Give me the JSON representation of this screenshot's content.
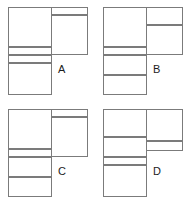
{
  "figure": {
    "kind": "multiple-choice-shape-options",
    "line_color": "#7b7b7b",
    "fill_color": "#ffffff",
    "label_color": "#1c1c1c",
    "background": "#ffffff",
    "option_count": 4
  },
  "options": [
    {
      "id": "a",
      "label": "A",
      "left_column": {
        "x": 0,
        "width": 44,
        "cells": [
          {
            "name": "large-box",
            "y": 0,
            "height": 40
          },
          {
            "name": "thin-strip",
            "y": 40,
            "height": 8
          },
          {
            "name": "thin-strip",
            "y": 48,
            "height": 8
          },
          {
            "name": "large-box",
            "y": 56,
            "height": 32
          }
        ]
      },
      "right_column": {
        "x": 43,
        "width": 37,
        "cells": [
          {
            "name": "thin-strip",
            "y": 0,
            "height": 8
          },
          {
            "name": "large-box",
            "y": 8,
            "height": 40
          }
        ]
      }
    },
    {
      "id": "b",
      "label": "B",
      "left_column": {
        "x": 0,
        "width": 44,
        "cells": [
          {
            "name": "large-box",
            "y": 0,
            "height": 40
          },
          {
            "name": "thin-strip",
            "y": 40,
            "height": 8
          },
          {
            "name": "medium-box",
            "y": 48,
            "height": 20
          },
          {
            "name": "medium-box",
            "y": 68,
            "height": 20
          }
        ]
      },
      "right_column": {
        "x": 43,
        "width": 37,
        "cells": [
          {
            "name": "medium-box",
            "y": 0,
            "height": 18
          },
          {
            "name": "medium-box",
            "y": 18,
            "height": 30
          }
        ]
      }
    },
    {
      "id": "c",
      "label": "C",
      "left_column": {
        "x": 0,
        "width": 44,
        "cells": [
          {
            "name": "large-box",
            "y": 0,
            "height": 40
          },
          {
            "name": "thin-strip",
            "y": 40,
            "height": 8
          },
          {
            "name": "medium-box",
            "y": 48,
            "height": 20
          },
          {
            "name": "medium-box",
            "y": 68,
            "height": 20
          }
        ]
      },
      "right_column": {
        "x": 43,
        "width": 37,
        "cells": [
          {
            "name": "thin-strip",
            "y": 0,
            "height": 8
          },
          {
            "name": "large-box",
            "y": 8,
            "height": 40
          }
        ]
      }
    },
    {
      "id": "d",
      "label": "D",
      "left_column": {
        "x": 0,
        "width": 44,
        "cells": [
          {
            "name": "medium-box",
            "y": 0,
            "height": 28
          },
          {
            "name": "medium-box",
            "y": 28,
            "height": 20
          },
          {
            "name": "thin-strip",
            "y": 48,
            "height": 8
          },
          {
            "name": "large-box",
            "y": 56,
            "height": 32
          }
        ]
      },
      "right_column": {
        "x": 43,
        "width": 37,
        "cells": [
          {
            "name": "large-box",
            "y": 0,
            "height": 32
          },
          {
            "name": "thin-strip",
            "y": 32,
            "height": 10
          }
        ]
      }
    }
  ]
}
